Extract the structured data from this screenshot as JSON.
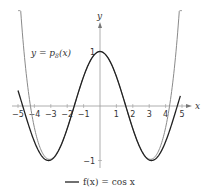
{
  "chart_data": {
    "type": "line",
    "title": "",
    "xlabel": "x",
    "ylabel": "y",
    "xlim": [
      -5.1,
      5.3
    ],
    "ylim": [
      -1.15,
      1.9
    ],
    "x_ticks": [
      -5,
      -4,
      -3,
      -2,
      -1,
      1,
      2,
      3,
      4,
      5
    ],
    "x_tick_labels": [
      "−5",
      "−4",
      "−3",
      "−2",
      "−1",
      "1",
      "2",
      "3",
      "4",
      "5"
    ],
    "y_ticks": [
      1,
      -1
    ],
    "y_tick_labels": [
      "1",
      "−1"
    ],
    "grid": false,
    "series": [
      {
        "name": "f(x) = cos x",
        "function": "cos(x)",
        "color": "#222222",
        "domain": [
          -5,
          4.9
        ]
      },
      {
        "name": "y = p8(x)",
        "function": "1 - x^2/2 + x^4/24 - x^6/720 + x^8/40320",
        "color": "#888888",
        "domain": [
          -5.0,
          5.0
        ]
      }
    ],
    "annotations": [
      {
        "text": "y = p8(x)",
        "position": "upper-left"
      }
    ],
    "legend": {
      "position": "bottom-center",
      "entries": [
        "f(x) = cos x"
      ]
    }
  },
  "labels": {
    "x_axis": "x",
    "y_axis": "y",
    "curve_label": "y = p",
    "curve_label_sub": "8",
    "curve_label_tail": "(x)",
    "legend_text": "f(x) = cos x"
  }
}
